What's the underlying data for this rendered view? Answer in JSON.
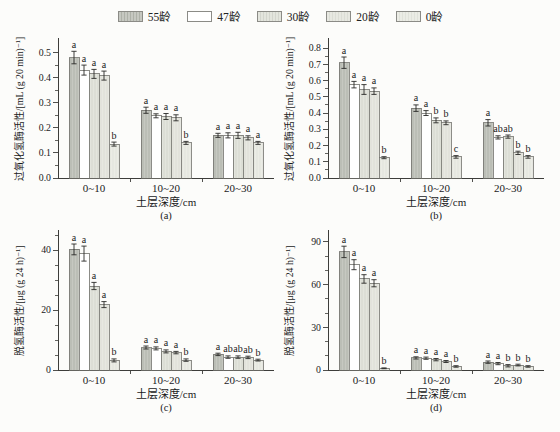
{
  "page": {
    "background": "#fcfcfa"
  },
  "legend": {
    "items": [
      {
        "label": "55龄",
        "series": "s55"
      },
      {
        "label": "47龄",
        "series": "s47"
      },
      {
        "label": "30龄",
        "series": "s30"
      },
      {
        "label": "20龄",
        "series": "s20"
      },
      {
        "label": "0龄",
        "series": "s0"
      }
    ]
  },
  "colors": {
    "axis": "#3d3d3a",
    "bar_stroke": "#6f6f6a",
    "error": "#2a2a28",
    "series": {
      "s55": {
        "base": "#c6c8c1",
        "stripe": "#aeb1a8"
      },
      "s47": {
        "base": "#ffffff",
        "stripe": null
      },
      "s30": {
        "base": "#e3e5dd",
        "stripe": "#d3d5cd"
      },
      "s20": {
        "base": "#e7e8e1",
        "stripe": "#dbddd5"
      },
      "s0": {
        "base": "#ebece5",
        "stripe": "#e0e2da"
      }
    }
  },
  "chart_data": [
    {
      "id": "a",
      "type": "bar",
      "caption": "(a)",
      "ylabel": "过氧化氢酶活性/[mL (g 20 min)⁻¹]",
      "xlabel": "土层深度/cm",
      "categories": [
        "0~10",
        "10~20",
        "20~30"
      ],
      "ymax": 0.55,
      "yticks": {
        "values": [
          0,
          0.1,
          0.2,
          0.3,
          0.4,
          0.5
        ],
        "labels": [
          "0.0",
          "0.1",
          "0.2",
          "0.3",
          "0.4",
          "0.5"
        ]
      },
      "yminor": [
        0.05,
        0.15,
        0.25,
        0.35,
        0.45
      ],
      "series": [
        {
          "name": "55龄",
          "key": "s55",
          "values": [
            0.48,
            0.27,
            0.17
          ],
          "errors": [
            0.025,
            0.012,
            0.008
          ],
          "letters": [
            "a",
            "a",
            "a"
          ]
        },
        {
          "name": "47龄",
          "key": "s47",
          "values": [
            0.43,
            0.248,
            0.17
          ],
          "errors": [
            0.02,
            0.008,
            0.01
          ],
          "letters": [
            "a",
            "a",
            "a"
          ]
        },
        {
          "name": "30龄",
          "key": "s30",
          "values": [
            0.415,
            0.245,
            0.17
          ],
          "errors": [
            0.018,
            0.012,
            0.012
          ],
          "letters": [
            "a",
            "a",
            "a"
          ]
        },
        {
          "name": "20龄",
          "key": "s20",
          "values": [
            0.408,
            0.24,
            0.16
          ],
          "errors": [
            0.018,
            0.012,
            0.008
          ],
          "letters": [
            "a",
            "a",
            "a"
          ]
        },
        {
          "name": "0龄",
          "key": "s0",
          "values": [
            0.135,
            0.14,
            0.14
          ],
          "errors": [
            0.008,
            0.006,
            0.006
          ],
          "letters": [
            "b",
            "b",
            "a"
          ]
        }
      ]
    },
    {
      "id": "b",
      "type": "bar",
      "caption": "(b)",
      "ylabel": "过氧化氢酶活性/[mL (g 20 min)⁻¹]",
      "xlabel": "土层深度/cm",
      "categories": [
        "0~10",
        "10~20",
        "20~30"
      ],
      "ymax": 0.85,
      "yticks": {
        "values": [
          0,
          0.1,
          0.2,
          0.3,
          0.4,
          0.5,
          0.6,
          0.7,
          0.8
        ],
        "labels": [
          "0.0",
          "0.1",
          "0.2",
          "0.3",
          "0.4",
          "0.5",
          "0.6",
          "0.7",
          "0.8"
        ]
      },
      "yminor": [
        0.05,
        0.15,
        0.25,
        0.35,
        0.45,
        0.55,
        0.65,
        0.75
      ],
      "series": [
        {
          "name": "55龄",
          "key": "s55",
          "values": [
            0.71,
            0.43,
            0.34
          ],
          "errors": [
            0.035,
            0.02,
            0.02
          ],
          "letters": [
            "a",
            "a",
            "a"
          ]
        },
        {
          "name": "47龄",
          "key": "s47",
          "values": [
            0.575,
            0.4,
            0.25
          ],
          "errors": [
            0.02,
            0.015,
            0.01
          ],
          "letters": [
            "a",
            "a",
            "ab"
          ]
        },
        {
          "name": "30龄",
          "key": "s30",
          "values": [
            0.545,
            0.355,
            0.255
          ],
          "errors": [
            0.03,
            0.015,
            0.01
          ],
          "letters": [
            "a",
            "b",
            "ab"
          ]
        },
        {
          "name": "20龄",
          "key": "s20",
          "values": [
            0.535,
            0.34,
            0.155
          ],
          "errors": [
            0.02,
            0.012,
            0.01
          ],
          "letters": [
            "a",
            "b",
            "b"
          ]
        },
        {
          "name": "0龄",
          "key": "s0",
          "values": [
            0.125,
            0.13,
            0.13
          ],
          "errors": [
            0.006,
            0.008,
            0.008
          ],
          "letters": [
            "b",
            "c",
            "b"
          ]
        }
      ]
    },
    {
      "id": "c",
      "type": "bar",
      "caption": "(c)",
      "ylabel": "脱氢酶活性/[μg (g 24 h)⁻¹]",
      "xlabel": "土层深度/cm",
      "categories": [
        "0~10",
        "10~20",
        "20~30"
      ],
      "ymax": 46,
      "yticks": {
        "values": [
          0,
          20,
          40
        ],
        "labels": [
          "0",
          "20",
          "40"
        ]
      },
      "yminor": [
        5,
        10,
        15,
        25,
        30,
        35,
        45
      ],
      "series": [
        {
          "name": "55龄",
          "key": "s55",
          "values": [
            40.2,
            7.5,
            5.2
          ],
          "errors": [
            1.8,
            0.5,
            0.4
          ],
          "letters": [
            "a",
            "a",
            "a"
          ]
        },
        {
          "name": "47龄",
          "key": "s47",
          "values": [
            38.8,
            7.2,
            4.3
          ],
          "errors": [
            2.5,
            0.5,
            0.4
          ],
          "letters": [
            "a",
            "a",
            "ab"
          ]
        },
        {
          "name": "30龄",
          "key": "s30",
          "values": [
            28.0,
            6.2,
            4.3
          ],
          "errors": [
            1.2,
            0.5,
            0.4
          ],
          "letters": [
            "a",
            "a",
            "ab"
          ]
        },
        {
          "name": "20龄",
          "key": "s20",
          "values": [
            21.8,
            5.8,
            4.2
          ],
          "errors": [
            1.0,
            0.4,
            0.4
          ],
          "letters": [
            "a",
            "a",
            "ab"
          ]
        },
        {
          "name": "0龄",
          "key": "s0",
          "values": [
            3.2,
            3.3,
            3.3
          ],
          "errors": [
            0.5,
            0.4,
            0.3
          ],
          "letters": [
            "b",
            "b",
            "b"
          ]
        }
      ]
    },
    {
      "id": "d",
      "type": "bar",
      "caption": "(d)",
      "ylabel": "脱氢酶活性/[μg (g 24 h)⁻¹]",
      "xlabel": "土层深度/cm",
      "categories": [
        "0~10",
        "10~20",
        "20~30"
      ],
      "ymax": 97,
      "yticks": {
        "values": [
          0,
          30,
          60,
          90
        ],
        "labels": [
          "0",
          "30",
          "60",
          "90"
        ]
      },
      "yminor": [
        10,
        20,
        40,
        50,
        70,
        80
      ],
      "series": [
        {
          "name": "55龄",
          "key": "s55",
          "values": [
            83,
            8.5,
            5.5
          ],
          "errors": [
            4,
            0.8,
            0.8
          ],
          "letters": [
            "a",
            "a",
            "a"
          ]
        },
        {
          "name": "47龄",
          "key": "s47",
          "values": [
            74,
            8.3,
            4.5
          ],
          "errors": [
            3.5,
            0.8,
            0.8
          ],
          "letters": [
            "a",
            "a",
            "a"
          ]
        },
        {
          "name": "30龄",
          "key": "s30",
          "values": [
            64,
            7.3,
            3.0
          ],
          "errors": [
            3,
            0.8,
            0.8
          ],
          "letters": [
            "a",
            "a",
            "b"
          ]
        },
        {
          "name": "20龄",
          "key": "s20",
          "values": [
            61,
            6.0,
            3.5
          ],
          "errors": [
            2.5,
            0.7,
            0.6
          ],
          "letters": [
            "a",
            "a",
            "b"
          ]
        },
        {
          "name": "0龄",
          "key": "s0",
          "values": [
            1.2,
            2.5,
            2.5
          ],
          "errors": [
            0.3,
            0.5,
            0.5
          ],
          "letters": [
            "b",
            "b",
            "b"
          ]
        }
      ]
    }
  ]
}
